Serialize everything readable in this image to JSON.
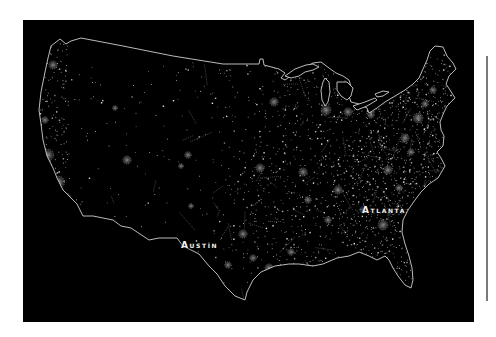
{
  "map": {
    "title": "Contiguous United States — settlement / night-light density",
    "background_color": "#000000",
    "border_color": "#cfcfcf",
    "dot_color": "#bdbdbd",
    "labels": [
      {
        "id": "austin",
        "text": "Austin",
        "x": 181,
        "y": 246
      },
      {
        "id": "atlanta",
        "text": "Atlanta",
        "x": 362,
        "y": 211
      }
    ]
  },
  "side_bar": {
    "color": "#7a7a7a"
  }
}
